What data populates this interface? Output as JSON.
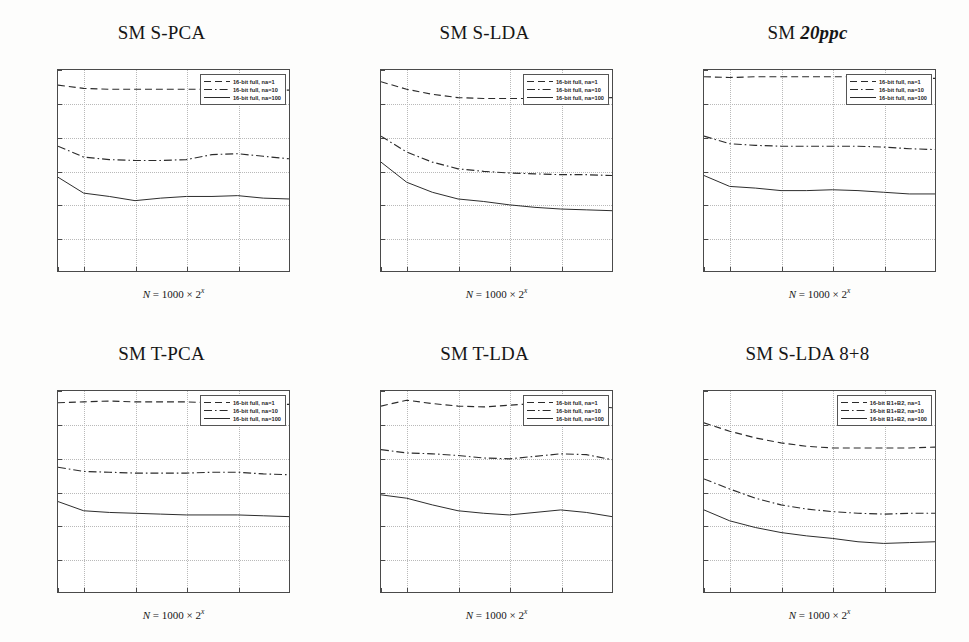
{
  "figure": {
    "layout": "2 rows x 3 columns of line plots",
    "background_color": "#fdfdfc"
  },
  "axis_common": {
    "ylabel": "Guessing entropy (bits)",
    "xlabel_prefix": "N",
    "xlabel_eq": " = 1000 × 2",
    "xlabel_exp": "x",
    "yticks": [
      "12",
      "10",
      "8",
      "6",
      "4",
      "2",
      "0"
    ],
    "xticks": [
      "1",
      "2",
      "4",
      "6",
      "8",
      "10"
    ],
    "ylim": [
      0,
      12
    ],
    "xlim": [
      1,
      10
    ],
    "grid": "dotted"
  },
  "legend_full": [
    "16-bit full, na=1",
    "16-bit full, na=10",
    "16-bit full, na=100"
  ],
  "legend_b1b2": [
    "16-bit B1+B2, na=1",
    "16-bit B1+B2, na=10",
    "16-bit B1+B2, na=100"
  ],
  "panels": [
    {
      "title_main": "SM S-PCA",
      "title_italic": ""
    },
    {
      "title_main": "SM S-LDA",
      "title_italic": ""
    },
    {
      "title_main": "SM ",
      "title_italic": "20ppc"
    },
    {
      "title_main": "SM T-PCA",
      "title_italic": ""
    },
    {
      "title_main": "SM T-LDA",
      "title_italic": ""
    },
    {
      "title_main": "SM S-LDA 8+8",
      "title_italic": ""
    }
  ],
  "chart_data": [
    {
      "type": "line",
      "title": "SM S-PCA",
      "xlabel": "N = 1000 × 2^x",
      "ylabel": "Guessing entropy (bits)",
      "xlim": [
        1,
        10
      ],
      "ylim": [
        0,
        12
      ],
      "grid": true,
      "legend_position": "top-right",
      "x": [
        1,
        2,
        3,
        4,
        5,
        6,
        7,
        8,
        9,
        10
      ],
      "series": [
        {
          "name": "16-bit full, na=1",
          "style": "dashed",
          "values": [
            11.1,
            10.9,
            10.85,
            10.85,
            10.85,
            10.85,
            10.85,
            10.85,
            10.8,
            10.8
          ]
        },
        {
          "name": "16-bit full, na=10",
          "style": "dashdot",
          "values": [
            7.45,
            6.8,
            6.65,
            6.6,
            6.6,
            6.65,
            6.95,
            7.0,
            6.85,
            6.7
          ]
        },
        {
          "name": "16-bit full, na=100",
          "style": "solid",
          "values": [
            5.6,
            4.65,
            4.45,
            4.2,
            4.35,
            4.45,
            4.45,
            4.5,
            4.35,
            4.3
          ]
        }
      ]
    },
    {
      "type": "line",
      "title": "SM S-LDA",
      "xlabel": "N = 1000 × 2^x",
      "ylabel": "Guessing entropy (bits)",
      "xlim": [
        1,
        10
      ],
      "ylim": [
        0,
        12
      ],
      "grid": true,
      "legend_position": "top-right",
      "x": [
        1,
        2,
        3,
        4,
        5,
        6,
        7,
        8,
        9,
        10
      ],
      "series": [
        {
          "name": "16-bit full, na=1",
          "style": "dashed",
          "values": [
            11.3,
            10.85,
            10.55,
            10.35,
            10.3,
            10.3,
            10.3,
            10.3,
            10.3,
            10.35
          ]
        },
        {
          "name": "16-bit full, na=10",
          "style": "dashdot",
          "values": [
            8.05,
            7.1,
            6.5,
            6.1,
            5.95,
            5.85,
            5.8,
            5.75,
            5.75,
            5.7
          ]
        },
        {
          "name": "16-bit full, na=100",
          "style": "solid",
          "values": [
            6.5,
            5.3,
            4.7,
            4.3,
            4.15,
            3.95,
            3.8,
            3.7,
            3.65,
            3.6
          ]
        }
      ]
    },
    {
      "type": "line",
      "title": "SM 20ppc",
      "xlabel": "N = 1000 × 2^x",
      "ylabel": "Guessing entropy (bits)",
      "xlim": [
        1,
        10
      ],
      "ylim": [
        0,
        12
      ],
      "grid": true,
      "legend_position": "top-right",
      "x": [
        1,
        2,
        3,
        4,
        5,
        6,
        7,
        8,
        9,
        10
      ],
      "series": [
        {
          "name": "16-bit full, na=1",
          "style": "dashed",
          "values": [
            11.6,
            11.55,
            11.6,
            11.6,
            11.6,
            11.6,
            11.6,
            11.6,
            11.55,
            11.5
          ]
        },
        {
          "name": "16-bit full, na=10",
          "style": "dashdot",
          "values": [
            8.05,
            7.6,
            7.5,
            7.45,
            7.45,
            7.45,
            7.45,
            7.4,
            7.3,
            7.25
          ]
        },
        {
          "name": "16-bit full, na=100",
          "style": "solid",
          "values": [
            5.7,
            5.05,
            4.95,
            4.8,
            4.8,
            4.85,
            4.8,
            4.7,
            4.6,
            4.6
          ]
        }
      ]
    },
    {
      "type": "line",
      "title": "SM T-PCA",
      "xlabel": "N = 1000 × 2^x",
      "ylabel": "Guessing entropy (bits)",
      "xlim": [
        1,
        10
      ],
      "ylim": [
        0,
        12
      ],
      "grid": true,
      "legend_position": "top-right",
      "x": [
        1,
        2,
        3,
        4,
        5,
        6,
        7,
        8,
        9,
        10
      ],
      "series": [
        {
          "name": "16-bit full, na=1",
          "style": "dashed",
          "values": [
            11.3,
            11.35,
            11.4,
            11.35,
            11.35,
            11.35,
            11.3,
            11.25,
            11.2,
            11.2
          ]
        },
        {
          "name": "16-bit full, na=10",
          "style": "dashdot",
          "values": [
            7.45,
            7.2,
            7.15,
            7.1,
            7.1,
            7.1,
            7.15,
            7.15,
            7.05,
            7.0
          ]
        },
        {
          "name": "16-bit full, na=100",
          "style": "solid",
          "values": [
            5.4,
            4.85,
            4.75,
            4.7,
            4.65,
            4.6,
            4.6,
            4.6,
            4.55,
            4.5
          ]
        }
      ]
    },
    {
      "type": "line",
      "title": "SM T-LDA",
      "xlabel": "N = 1000 × 2^x",
      "ylabel": "Guessing entropy (bits)",
      "xlim": [
        1,
        10
      ],
      "ylim": [
        0,
        12
      ],
      "grid": true,
      "legend_position": "top-right",
      "x": [
        1,
        2,
        3,
        4,
        5,
        6,
        7,
        8,
        9,
        10
      ],
      "series": [
        {
          "name": "16-bit full, na=1",
          "style": "dashed",
          "values": [
            11.1,
            11.45,
            11.25,
            11.1,
            11.05,
            11.15,
            11.25,
            11.2,
            11.1,
            11.0
          ]
        },
        {
          "name": "16-bit full, na=10",
          "style": "dashdot",
          "values": [
            8.5,
            8.3,
            8.25,
            8.15,
            8.0,
            7.95,
            8.1,
            8.25,
            8.2,
            7.9
          ]
        },
        {
          "name": "16-bit full, na=100",
          "style": "solid",
          "values": [
            5.8,
            5.6,
            5.2,
            4.85,
            4.7,
            4.6,
            4.75,
            4.9,
            4.75,
            4.5
          ]
        }
      ]
    },
    {
      "type": "line",
      "title": "SM S-LDA 8+8",
      "xlabel": "N = 1000 × 2^x",
      "ylabel": "Guessing entropy (bits)",
      "xlim": [
        1,
        10
      ],
      "ylim": [
        0,
        12
      ],
      "grid": true,
      "legend_position": "top-right",
      "x": [
        1,
        2,
        3,
        4,
        5,
        6,
        7,
        8,
        9,
        10
      ],
      "series": [
        {
          "name": "16-bit B1+B2, na=1",
          "style": "dashed",
          "values": [
            10.1,
            9.6,
            9.2,
            8.9,
            8.7,
            8.6,
            8.6,
            8.6,
            8.6,
            8.65
          ]
        },
        {
          "name": "16-bit B1+B2, na=10",
          "style": "dashdot",
          "values": [
            6.75,
            6.15,
            5.6,
            5.2,
            4.95,
            4.8,
            4.7,
            4.65,
            4.7,
            4.7
          ]
        },
        {
          "name": "16-bit B1+B2, na=100",
          "style": "solid",
          "values": [
            4.9,
            4.25,
            3.85,
            3.55,
            3.35,
            3.2,
            3.0,
            2.9,
            2.95,
            3.0
          ]
        }
      ]
    }
  ]
}
